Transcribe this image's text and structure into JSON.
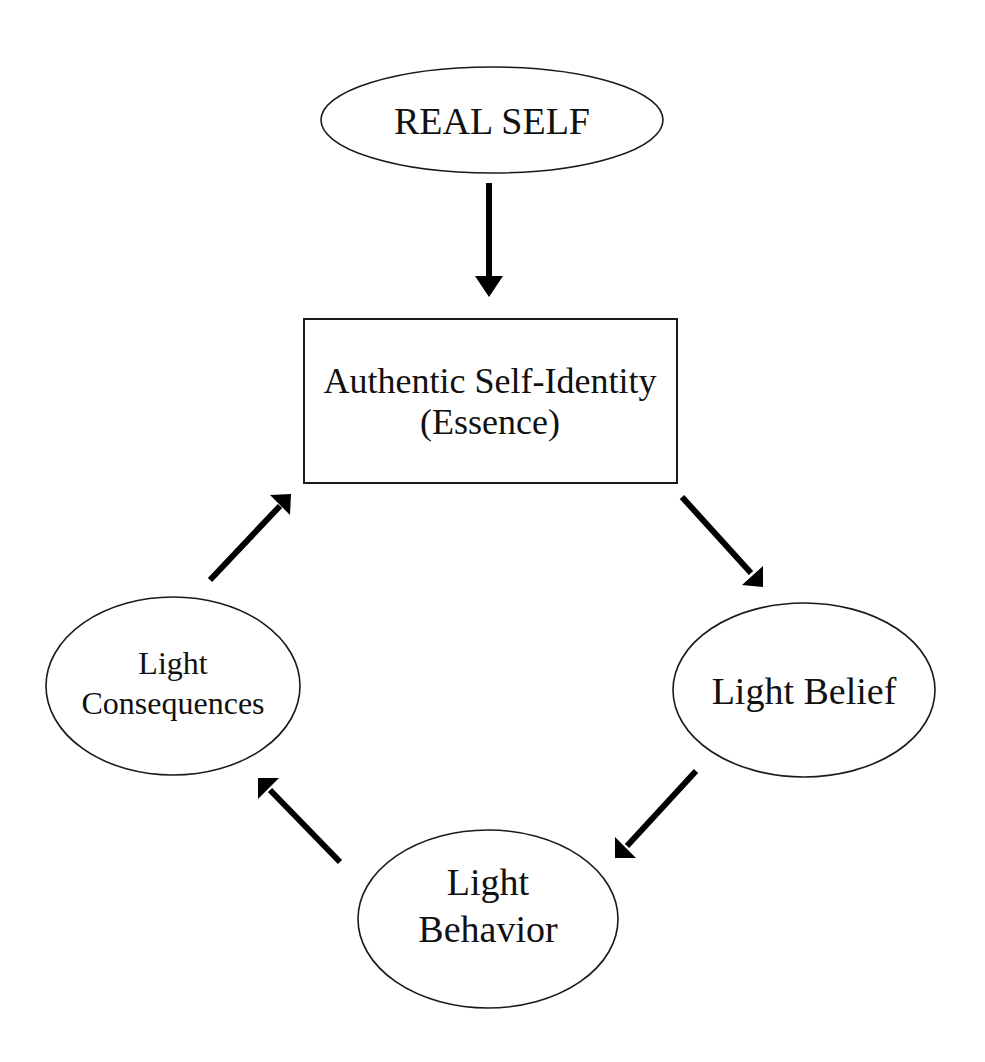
{
  "nodes": {
    "real_self": {
      "label": "REAL SELF",
      "shape": "ellipse"
    },
    "authentic_identity": {
      "line1": "Authentic Self-Identity",
      "line2": "(Essence)",
      "shape": "rectangle"
    },
    "light_belief": {
      "label": "Light Belief",
      "shape": "ellipse"
    },
    "light_behavior": {
      "line1": "Light",
      "line2": "Behavior",
      "shape": "ellipse"
    },
    "light_consequences": {
      "line1": "Light",
      "line2": "Consequences",
      "shape": "ellipse"
    }
  },
  "edges": [
    {
      "from": "REAL SELF",
      "to": "Authentic Self-Identity (Essence)"
    },
    {
      "from": "Authentic Self-Identity (Essence)",
      "to": "Light Belief"
    },
    {
      "from": "Light Belief",
      "to": "Light Behavior"
    },
    {
      "from": "Light Behavior",
      "to": "Light Consequences"
    },
    {
      "from": "Light Consequences",
      "to": "Authentic Self-Identity (Essence)"
    }
  ],
  "colors": {
    "stroke": "#1a1a1a",
    "arrow": "#000000",
    "background": "#ffffff"
  }
}
